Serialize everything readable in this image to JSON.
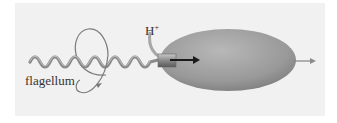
{
  "diagram": {
    "labels": {
      "flagellum": "flagellum",
      "ion": "H",
      "ion_charge": "+"
    },
    "elements": [
      {
        "name": "flagellum",
        "type": "helix"
      },
      {
        "name": "rotation-arrow",
        "type": "curved-arrow"
      },
      {
        "name": "proton-path",
        "type": "curved-line"
      },
      {
        "name": "motor",
        "type": "cylinder"
      },
      {
        "name": "cell-body",
        "type": "ellipse"
      },
      {
        "name": "proton-flow-arrow",
        "type": "arrow"
      },
      {
        "name": "motion-arrow",
        "type": "arrow"
      }
    ],
    "colors": {
      "background": "#f1f1f1",
      "cell": "#9a9a9a",
      "helix": "#8a8a8a",
      "arrow_dark": "#1a1a1a",
      "arrow_light": "#8c8c8c"
    }
  }
}
